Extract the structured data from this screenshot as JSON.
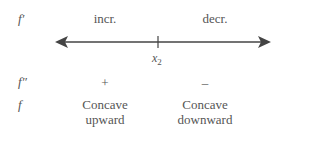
{
  "rows": {
    "first_derivative": {
      "label": "f′",
      "left": "incr.",
      "right": "decr."
    },
    "second_derivative": {
      "label": "f″",
      "left": "+",
      "right": "–"
    },
    "function": {
      "label": "f",
      "left": "Concave upward",
      "right": "Concave downward",
      "left_lines": [
        "Concave",
        "upward"
      ],
      "right_lines": [
        "Concave",
        "downward"
      ]
    }
  },
  "number_line": {
    "point_label": "x",
    "point_subscript": "2",
    "color": "#444444"
  }
}
